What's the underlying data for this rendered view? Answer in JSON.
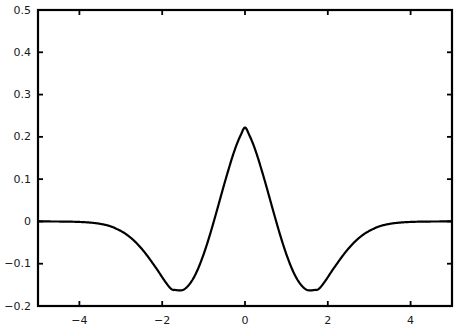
{
  "chart_data": {
    "type": "line",
    "title": "",
    "subtitle": "",
    "xlabel": "",
    "ylabel": "",
    "xlim": [
      -5,
      5
    ],
    "ylim": [
      -0.2,
      0.5
    ],
    "grid": false,
    "legend": null,
    "annotations": [],
    "xticks": [
      -4,
      -2,
      0,
      2,
      4
    ],
    "xtick_labels": [
      "-4",
      "-2",
      "0",
      "2",
      "4"
    ],
    "yticks": [
      -0.2,
      -0.1,
      0,
      0.1,
      0.2,
      0.3,
      0.4,
      0.5
    ],
    "ytick_labels": [
      "-0.2",
      "-0.1",
      "0",
      "0.1",
      "0.2",
      "0.3",
      "0.4",
      "0.5"
    ],
    "line_color": "#000000",
    "line_width": 2.2,
    "series": [
      {
        "name": "(1 - x^2) * phi(x)",
        "x": [
          -5.0,
          -4.8,
          -4.6,
          -4.4,
          -4.2,
          -4.0,
          -3.8,
          -3.6,
          -3.4,
          -3.2,
          -3.0,
          -2.9,
          -2.8,
          -2.7,
          -2.6,
          -2.5,
          -2.4,
          -2.3,
          -2.2,
          -2.1,
          -2.0,
          -1.9,
          -1.8,
          -1.732,
          -1.7,
          -1.6,
          -1.5,
          -1.4,
          -1.3,
          -1.2,
          -1.1,
          -1.0,
          -0.9,
          -0.8,
          -0.7,
          -0.6,
          -0.5,
          -0.4,
          -0.3,
          -0.2,
          -0.1,
          0.0,
          0.1,
          0.2,
          0.3,
          0.4,
          0.5,
          0.6,
          0.7,
          0.8,
          0.9,
          1.0,
          1.1,
          1.2,
          1.3,
          1.4,
          1.5,
          1.6,
          1.7,
          1.732,
          1.8,
          1.9,
          2.0,
          2.1,
          2.2,
          2.3,
          2.4,
          2.5,
          2.6,
          2.7,
          2.8,
          2.9,
          3.0,
          3.2,
          3.4,
          3.6,
          3.8,
          4.0,
          4.2,
          4.4,
          4.6,
          4.8,
          5.0
        ],
        "y": [
          -3.43e-05,
          -7.34e-05,
          -0.000153,
          -0.000311,
          -0.000618,
          -0.0012,
          -0.00227,
          -0.00419,
          -0.00754,
          -0.0132,
          -0.0222,
          -0.0283,
          -0.0354,
          -0.0437,
          -0.0533,
          -0.0641,
          -0.0761,
          -0.0892,
          -0.103,
          -0.117,
          -0.132,
          -0.146,
          -0.158,
          -0.162,
          -0.162,
          -0.163,
          -0.162,
          -0.155,
          -0.143,
          -0.126,
          -0.104,
          -0.0779,
          -0.0483,
          -0.0159,
          0.0183,
          0.0535,
          0.0885,
          0.122,
          0.154,
          0.182,
          0.205,
          0.2221,
          0.205,
          0.182,
          0.154,
          0.122,
          0.0885,
          0.0535,
          0.0183,
          -0.0159,
          -0.0483,
          -0.0779,
          -0.104,
          -0.126,
          -0.143,
          -0.155,
          -0.162,
          -0.163,
          -0.162,
          -0.162,
          -0.158,
          -0.146,
          -0.132,
          -0.117,
          -0.103,
          -0.0892,
          -0.0761,
          -0.0641,
          -0.0533,
          -0.0437,
          -0.0354,
          -0.0283,
          -0.0222,
          -0.0132,
          -0.00754,
          -0.00419,
          -0.00227,
          -0.0012,
          -0.000618,
          -0.000311,
          -0.000153,
          -7.34e-05,
          -3.43e-05
        ],
        "peak": {
          "x": 0,
          "y": 0.3989
        },
        "minima": [
          {
            "x": -1.732,
            "y": -0.162
          },
          {
            "x": 1.732,
            "y": -0.162
          }
        ]
      }
    ]
  },
  "axes": {
    "frame_color": "#000000",
    "frame_width": 2.2,
    "background": "#ffffff",
    "ticks_on_all_sides": true
  }
}
